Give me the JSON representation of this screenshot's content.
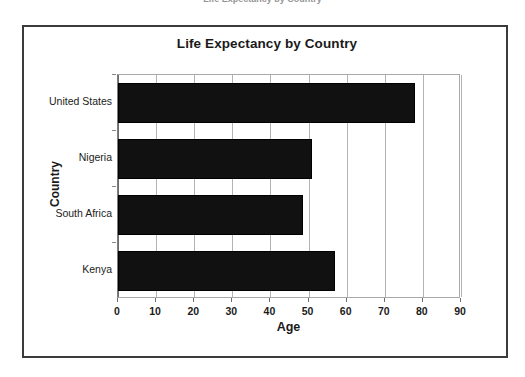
{
  "top_sliver_text": "Life Expectancy by Country",
  "figure": {
    "title": "Life Expectancy by Country",
    "border_color": "#3b3b3b",
    "background": "#ffffff"
  },
  "chart_data": {
    "type": "bar",
    "orientation": "horizontal",
    "title": "Life Expectancy by Country",
    "xlabel": "Age",
    "ylabel": "Country",
    "categories": [
      "United States",
      "Nigeria",
      "South Africa",
      "Kenya"
    ],
    "values": [
      78,
      51,
      48.5,
      57
    ],
    "xlim": [
      0,
      90
    ],
    "xticks": [
      0,
      10,
      20,
      30,
      40,
      50,
      60,
      70,
      80,
      90
    ],
    "xtick_labels": [
      "0",
      "10",
      "20",
      "30",
      "40",
      "50",
      "60",
      "70",
      "80",
      "90"
    ],
    "grid": true,
    "grid_axis": "x",
    "legend": false,
    "bar_color": "#111111",
    "gridline_color": "#b3b3b3"
  }
}
